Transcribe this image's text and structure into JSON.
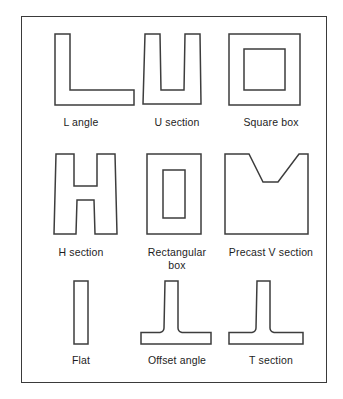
{
  "figure": {
    "background_color": "#ffffff",
    "border_color": "#3a3a3a",
    "stroke_color": "#3d3d3d",
    "label_color": "#1d1d1d",
    "caption_partial": ""
  },
  "shapes": [
    {
      "id": "l-angle",
      "label": "L angle",
      "row": 1,
      "column": 1,
      "description": "L shaped angle section, vertical leg on left, horizontal leg along bottom"
    },
    {
      "id": "u-section",
      "label": "U section",
      "row": 1,
      "column": 2,
      "description": "U shaped channel section, open at the top, slightly tapered sides"
    },
    {
      "id": "square-box",
      "label": "Square box",
      "row": 1,
      "column": 3,
      "description": "Hollow square box section with square void"
    },
    {
      "id": "h-section",
      "label": "H section",
      "row": 2,
      "column": 1,
      "description": "H shaped section with two tapered flanges and central web"
    },
    {
      "id": "rectangular-box",
      "label": "Rectangular\nbox",
      "row": 2,
      "column": 2,
      "description": "Hollow rectangular box section with rectangular void"
    },
    {
      "id": "precast-v-section",
      "label": "Precast V section",
      "row": 2,
      "column": 3,
      "description": "Rectangular section with a V shaped notch cut into the top, flat at the base of the notch"
    },
    {
      "id": "flat",
      "label": "Flat",
      "row": 3,
      "column": 1,
      "description": "Narrow tall flat rectangular bar"
    },
    {
      "id": "offset-angle",
      "label": "Offset angle",
      "row": 3,
      "column": 2,
      "description": "Horizontal base slab with an off-centre vertical stem and filleted junctions"
    },
    {
      "id": "t-section",
      "label": "T section",
      "row": 3,
      "column": 3,
      "description": "Horizontal base slab with a central vertical stem and filleted junctions"
    }
  ]
}
